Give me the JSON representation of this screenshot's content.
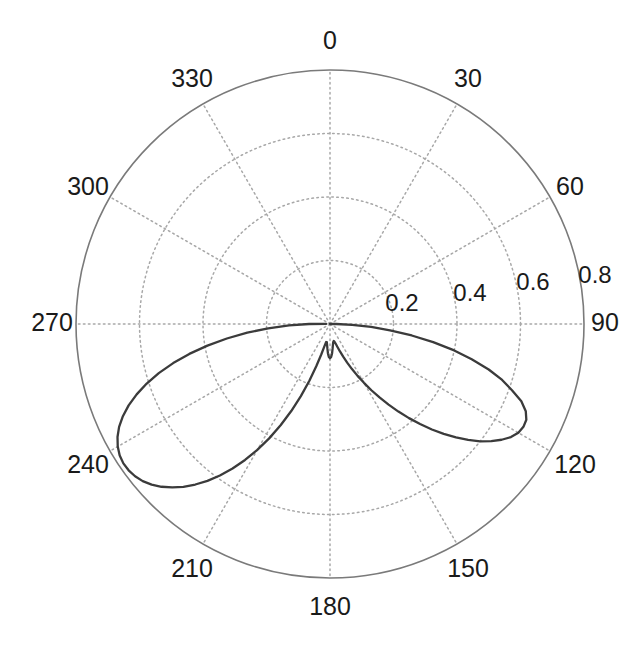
{
  "figure": {
    "background_color": "#ffffff",
    "type": "polar-plot"
  },
  "axes": {
    "center_x": 330,
    "center_y": 324,
    "outer_radius_px": 254,
    "angle_label_radius_px": 288,
    "grid_color": "#a8a8a8",
    "outer_circle_color": "#7a7a7a",
    "curve_color": "#3b3b3b",
    "text_color": "#1a1a1a"
  },
  "chart_data": {
    "type": "line",
    "plot_kind": "polar",
    "title": "",
    "xlabel": "",
    "ylabel": "",
    "theta_direction": "clockwise",
    "theta_zero_location": "N",
    "theta_unit": "degrees",
    "grid": true,
    "legend": null,
    "angular_ticks": [
      0,
      30,
      60,
      90,
      120,
      150,
      180,
      210,
      240,
      270,
      300,
      330
    ],
    "angular_tick_labels": [
      "0",
      "30",
      "60",
      "90",
      "120",
      "150",
      "180",
      "210",
      "240",
      "270",
      "300",
      "330"
    ],
    "radial_ticks": [
      0.2,
      0.4,
      0.6,
      0.8
    ],
    "radial_tick_labels": [
      "0.2",
      "0.4",
      "0.6",
      "0.8"
    ],
    "rlim": [
      0,
      0.8
    ],
    "radial_tick_angle_deg": 90,
    "series": [
      {
        "name": "radiation pattern",
        "theta": [
          88,
          90,
          92,
          94,
          96,
          98,
          100,
          102,
          104,
          106,
          108,
          110,
          112,
          114,
          116,
          118,
          120,
          122,
          124,
          126,
          128,
          130,
          132,
          134,
          136,
          138,
          140,
          142,
          144,
          146,
          148,
          150,
          152,
          154,
          156,
          158,
          160,
          162,
          164,
          166,
          168,
          170,
          172,
          174,
          176,
          178,
          180,
          182,
          184,
          186,
          188,
          190,
          192,
          194,
          196,
          198,
          200,
          202,
          204,
          206,
          208,
          210,
          212,
          214,
          216,
          218,
          220,
          222,
          224,
          226,
          228,
          230,
          232,
          234,
          236,
          238,
          240,
          242,
          244,
          246,
          248,
          250,
          252,
          254,
          256,
          258,
          260,
          262,
          264,
          266,
          268,
          270,
          272
        ],
        "r": [
          0.0,
          0.02,
          0.07,
          0.13,
          0.19,
          0.26,
          0.33,
          0.4,
          0.46,
          0.52,
          0.57,
          0.61,
          0.65,
          0.675,
          0.688,
          0.69,
          0.685,
          0.672,
          0.652,
          0.628,
          0.6,
          0.568,
          0.534,
          0.498,
          0.462,
          0.424,
          0.387,
          0.35,
          0.314,
          0.279,
          0.246,
          0.214,
          0.185,
          0.158,
          0.133,
          0.111,
          0.092,
          0.076,
          0.064,
          0.057,
          0.055,
          0.058,
          0.066,
          0.078,
          0.093,
          0.104,
          0.108,
          0.104,
          0.093,
          0.078,
          0.066,
          0.058,
          0.058,
          0.072,
          0.1,
          0.14,
          0.19,
          0.245,
          0.3,
          0.355,
          0.408,
          0.458,
          0.505,
          0.549,
          0.59,
          0.627,
          0.66,
          0.69,
          0.715,
          0.738,
          0.756,
          0.77,
          0.779,
          0.784,
          0.785,
          0.781,
          0.772,
          0.758,
          0.739,
          0.714,
          0.684,
          0.648,
          0.607,
          0.561,
          0.509,
          0.453,
          0.392,
          0.328,
          0.262,
          0.195,
          0.129,
          0.066,
          0.012,
          0.0
        ]
      }
    ]
  },
  "labels": {
    "angles": [
      {
        "text": "0",
        "x": 330,
        "y": 42
      },
      {
        "text": "30",
        "x": 468,
        "y": 80
      },
      {
        "text": "60",
        "x": 570,
        "y": 188
      },
      {
        "text": "90",
        "x": 605,
        "y": 324
      },
      {
        "text": "120",
        "x": 575,
        "y": 466
      },
      {
        "text": "150",
        "x": 468,
        "y": 570
      },
      {
        "text": "180",
        "x": 330,
        "y": 608
      },
      {
        "text": "210",
        "x": 192,
        "y": 570
      },
      {
        "text": "240",
        "x": 88,
        "y": 466
      },
      {
        "text": "270",
        "x": 52,
        "y": 324
      },
      {
        "text": "300",
        "x": 88,
        "y": 188
      },
      {
        "text": "330",
        "x": 192,
        "y": 80
      }
    ],
    "radial": [
      {
        "text": "0.2",
        "x": 402,
        "y": 305
      },
      {
        "text": "0.4",
        "x": 470,
        "y": 295
      },
      {
        "text": "0.6",
        "x": 533,
        "y": 284
      },
      {
        "text": "0.8",
        "x": 595,
        "y": 277
      }
    ]
  }
}
